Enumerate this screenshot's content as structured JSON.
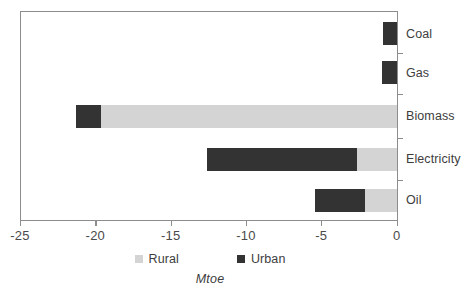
{
  "chart_data": {
    "type": "bar",
    "orientation": "horizontal",
    "stacked": true,
    "title": "",
    "subtitle": "",
    "xlabel": "Mtoe",
    "ylabel": "",
    "xlim": [
      -25,
      0
    ],
    "ylim": null,
    "grid": false,
    "legend_position": "bottom-center",
    "categories": [
      "Coal",
      "Gas",
      "Biomass",
      "Electricity",
      "Oil"
    ],
    "xticks": [
      -25,
      -20,
      -15,
      -10,
      -5,
      0
    ],
    "xtick_labels": [
      "-25",
      "-20",
      "-15",
      "-10",
      "-5",
      "0"
    ],
    "series": [
      {
        "name": "Rural",
        "color": "#d4d4d4",
        "values": [
          0.0,
          0.0,
          -19.6,
          -2.6,
          -2.1
        ]
      },
      {
        "name": "Urban",
        "color": "#333333",
        "values": [
          -0.9,
          -1.0,
          -1.7,
          -10.0,
          -3.3
        ]
      }
    ],
    "totals": [
      -0.9,
      -1.0,
      -21.3,
      -12.6,
      -5.4
    ],
    "annotations": []
  },
  "legend": {
    "items": [
      {
        "label": "Rural",
        "swatch": "rural-swatch"
      },
      {
        "label": "Urban",
        "swatch": "urban-swatch"
      }
    ]
  },
  "axis": {
    "x_title": "Mtoe"
  },
  "colors": {
    "rural": "#d4d4d4",
    "urban": "#333333",
    "axis": "#8d8d8d",
    "text": "#3d3d3d",
    "background": "#ffffff"
  }
}
